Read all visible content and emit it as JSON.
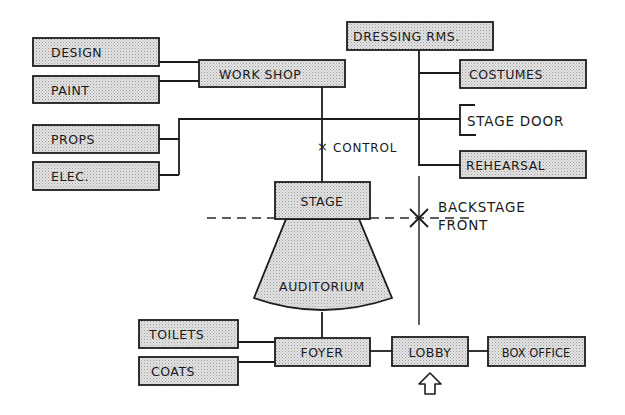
{
  "diagram": {
    "type": "theatre-space-relationship-diagram",
    "colors": {
      "ink": "#1c1c1c",
      "box_fill": "#d6d6d6",
      "background": "#ffffff"
    },
    "nodes": {
      "design": "DESIGN",
      "paint": "PAINT",
      "workshop": "WORK SHOP",
      "props": "PROPS",
      "elec": "ELEC.",
      "dressing_rooms": "DRESSING RMS.",
      "costumes": "COSTUMES",
      "stage_door": "STAGE DOOR",
      "rehearsal": "REHEARSAL",
      "stage": "STAGE",
      "auditorium": "AUDITORIUM",
      "toilets": "TOILETS",
      "coats": "COATS",
      "foyer": "FOYER",
      "lobby": "LOBBY",
      "box_office": "BOX OFFICE"
    },
    "annotations": {
      "control": "CONTROL",
      "control_marker": "×",
      "backstage": "BACKSTAGE",
      "front": "FRONT"
    },
    "edges": [
      [
        "DESIGN",
        "WORK SHOP"
      ],
      [
        "PAINT",
        "WORK SHOP"
      ],
      [
        "WORK SHOP",
        "STAGE"
      ],
      [
        "PROPS",
        "STAGE DOOR"
      ],
      [
        "ELEC.",
        "STAGE DOOR"
      ],
      [
        "DRESSING RMS.",
        "COSTUMES"
      ],
      [
        "DRESSING RMS.",
        "REHEARSAL"
      ],
      [
        "STAGE",
        "AUDITORIUM"
      ],
      [
        "AUDITORIUM",
        "FOYER"
      ],
      [
        "TOILETS",
        "FOYER"
      ],
      [
        "COATS",
        "FOYER"
      ],
      [
        "FOYER",
        "LOBBY"
      ],
      [
        "LOBBY",
        "BOX OFFICE"
      ]
    ],
    "entrance_arrow": "entrance-arrow"
  }
}
